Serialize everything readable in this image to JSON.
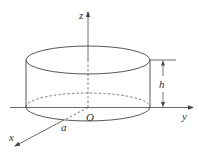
{
  "diagram": {
    "type": "3d-cylinder-coordinate-figure",
    "colors": {
      "stroke": "#444444",
      "background": "#ffffff",
      "text": "#333333"
    },
    "labels": {
      "z_axis": "z",
      "y_axis": "y",
      "x_axis": "x",
      "origin": "O",
      "height": "h",
      "radius": "a"
    }
  }
}
